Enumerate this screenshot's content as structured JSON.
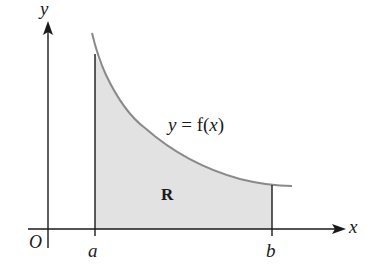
{
  "diagram": {
    "axes": {
      "x_label": "x",
      "y_label": "y",
      "origin_label": "O"
    },
    "bounds": {
      "a_label": "a",
      "b_label": "b"
    },
    "curve": {
      "label_lhs": "y",
      "label_eq": " = f(",
      "label_var": "x",
      "label_close": ")"
    },
    "region": {
      "label": "R"
    },
    "colors": {
      "axis": "#1a1a1a",
      "curve": "#8a8a8a",
      "region_fill": "#e2e2e2"
    }
  }
}
